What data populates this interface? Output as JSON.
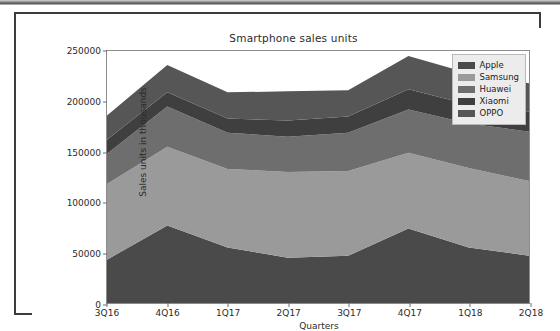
{
  "figure": {
    "background": "#ffffff",
    "frame_color": "#3c3c3c"
  },
  "chart_data": {
    "type": "area",
    "stacked": true,
    "title": "Smartphone sales units",
    "xlabel": "Quarters",
    "ylabel": "Sales units in thousands",
    "categories": [
      "3Q16",
      "4Q16",
      "1Q17",
      "2Q17",
      "3Q17",
      "4Q17",
      "1Q18",
      "2Q18"
    ],
    "ylim": [
      0,
      250000
    ],
    "yticks": [
      0,
      50000,
      100000,
      150000,
      200000,
      250000
    ],
    "ytick_labels": [
      "0",
      "50000",
      "100000",
      "150000",
      "200000",
      "250000"
    ],
    "grid": false,
    "legend_position": "upper right",
    "series": [
      {
        "name": "Apple",
        "color": "#4a4a4a",
        "values": [
          43000,
          77000,
          55000,
          45000,
          47000,
          74000,
          55000,
          47000
        ]
      },
      {
        "name": "Samsung",
        "color": "#9a9a9a",
        "values": [
          75000,
          78000,
          78000,
          85000,
          84000,
          75000,
          79000,
          74000
        ]
      },
      {
        "name": "Huawei",
        "color": "#6e6e6e",
        "values": [
          30000,
          40000,
          36000,
          35000,
          38000,
          43000,
          44000,
          49000
        ]
      },
      {
        "name": "Xiaomi",
        "color": "#3f3f3f",
        "values": [
          14000,
          14000,
          14000,
          16000,
          16000,
          20000,
          19000,
          20000
        ]
      },
      {
        "name": "OPPO",
        "color": "#565656",
        "values": [
          24000,
          27000,
          26000,
          29000,
          26000,
          33000,
          31000,
          28000
        ]
      }
    ],
    "cumulative_tops": [
      [
        43000,
        77000,
        55000,
        45000,
        47000,
        74000,
        55000,
        47000
      ],
      [
        118000,
        155000,
        133000,
        130000,
        131000,
        149000,
        134000,
        121000
      ],
      [
        148000,
        195000,
        169000,
        165000,
        169000,
        192000,
        178000,
        170000
      ],
      [
        162000,
        209000,
        183000,
        181000,
        185000,
        212000,
        197000,
        190000
      ],
      [
        186000,
        236000,
        209000,
        210000,
        211000,
        245000,
        228000,
        218000
      ]
    ]
  },
  "legend": {
    "items": [
      {
        "label": "Apple",
        "color": "#4a4a4a"
      },
      {
        "label": "Samsung",
        "color": "#9a9a9a"
      },
      {
        "label": "Huawei",
        "color": "#6e6e6e"
      },
      {
        "label": "Xiaomi",
        "color": "#3f3f3f"
      },
      {
        "label": "OPPO",
        "color": "#565656"
      }
    ]
  }
}
